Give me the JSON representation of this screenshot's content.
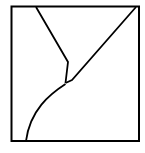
{
  "diagram": {
    "stroke_color": "#000000",
    "background_color": "#ffffff",
    "elements": [
      {
        "name": "frame",
        "kind": "square"
      },
      {
        "name": "left-boundary-line",
        "kind": "polyline",
        "from": "top edge",
        "to": "junction"
      },
      {
        "name": "right-diagonal-line",
        "kind": "line",
        "from": "top-right corner",
        "to": "junction"
      },
      {
        "name": "lower-curve",
        "kind": "curve",
        "from": "junction",
        "to": "bottom edge"
      }
    ]
  }
}
